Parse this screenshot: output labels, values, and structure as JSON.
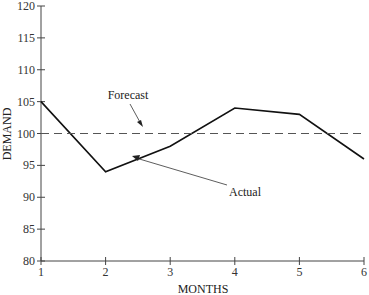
{
  "chart_data": {
    "type": "line",
    "title": "",
    "xlabel": "MONTHS",
    "ylabel": "DEMAND",
    "x": [
      1,
      2,
      3,
      4,
      5,
      6
    ],
    "ylim": [
      80,
      120
    ],
    "xlim": [
      1,
      6
    ],
    "yticks": [
      80,
      85,
      90,
      95,
      100,
      105,
      110,
      115,
      120
    ],
    "xticks": [
      1,
      2,
      3,
      4,
      5,
      6
    ],
    "grid": false,
    "series": [
      {
        "name": "Actual",
        "style": "solid",
        "values": [
          105,
          94,
          98,
          104,
          103,
          96
        ]
      },
      {
        "name": "Forecast",
        "style": "dashed",
        "values": [
          100,
          100,
          100,
          100,
          100,
          100
        ]
      }
    ],
    "annotations": [
      {
        "text": "Forecast",
        "points_to": "Forecast line near month 2.6"
      },
      {
        "text": "Actual",
        "points_to": "Actual line near month 2.5"
      }
    ]
  },
  "labels": {
    "xlabel": "MONTHS",
    "ylabel": "DEMAND",
    "forecast": "Forecast",
    "actual": "Actual"
  }
}
